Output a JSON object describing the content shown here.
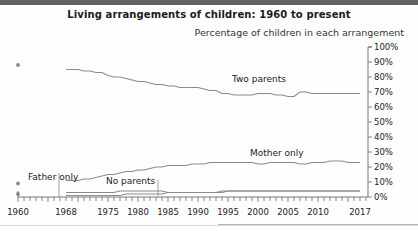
{
  "chart_data": {
    "type": "line",
    "title": "Living arrangements of children: 1960 to present",
    "subtitle": "Percentage of children in each arrangement",
    "xlabel": "",
    "ylabel": "",
    "ylim": [
      0,
      100
    ],
    "xlim": [
      1960,
      2018
    ],
    "grid": false,
    "legend_position": "inline-annotations",
    "y_ticks": [
      "0%",
      "10%",
      "20%",
      "30%",
      "40%",
      "50%",
      "60%",
      "70%",
      "80%",
      "90%",
      "100%"
    ],
    "y_tick_values": [
      0,
      10,
      20,
      30,
      40,
      50,
      60,
      70,
      80,
      90,
      100
    ],
    "x_ticks": [
      "1960",
      "1968",
      "1975",
      "1980",
      "1985",
      "1990",
      "1995",
      "2000",
      "2005",
      "2010",
      "2017"
    ],
    "x_tick_values": [
      1960,
      1968,
      1975,
      1980,
      1985,
      1990,
      1995,
      2000,
      2005,
      2010,
      2017
    ],
    "annotations": [
      {
        "text": "Two parents",
        "x": 2000,
        "y": 78
      },
      {
        "text": "Mother only",
        "x": 2003,
        "y": 29
      },
      {
        "text": "Father only",
        "x": 1966,
        "y": 13
      },
      {
        "text": "No parents",
        "x": 1979,
        "y": 10
      }
    ],
    "series": [
      {
        "name": "Two parents",
        "x": [
          1960,
          1968,
          1969,
          1970,
          1971,
          1972,
          1973,
          1974,
          1975,
          1976,
          1977,
          1978,
          1979,
          1980,
          1981,
          1982,
          1983,
          1984,
          1985,
          1986,
          1987,
          1988,
          1989,
          1990,
          1991,
          1992,
          1993,
          1994,
          1995,
          1996,
          1997,
          1998,
          1999,
          2000,
          2001,
          2002,
          2003,
          2004,
          2005,
          2006,
          2007,
          2008,
          2009,
          2010,
          2011,
          2012,
          2013,
          2014,
          2015,
          2016,
          2017
        ],
        "y": [
          88,
          85,
          85,
          85,
          84,
          84,
          83,
          83,
          81,
          80,
          80,
          79,
          78,
          77,
          77,
          76,
          75,
          75,
          74,
          74,
          73,
          73,
          73,
          73,
          72,
          71,
          71,
          69,
          69,
          68,
          68,
          68,
          68,
          69,
          69,
          69,
          68,
          68,
          67,
          67,
          70,
          70,
          69,
          69,
          69,
          69,
          69,
          69,
          69,
          69,
          69
        ]
      },
      {
        "name": "Mother only",
        "x": [
          1960,
          1968,
          1969,
          1970,
          1971,
          1972,
          1973,
          1974,
          1975,
          1976,
          1977,
          1978,
          1979,
          1980,
          1981,
          1982,
          1983,
          1984,
          1985,
          1986,
          1987,
          1988,
          1989,
          1990,
          1991,
          1992,
          1993,
          1994,
          1995,
          1996,
          1997,
          1998,
          1999,
          2000,
          2001,
          2002,
          2003,
          2004,
          2005,
          2006,
          2007,
          2008,
          2009,
          2010,
          2011,
          2012,
          2013,
          2014,
          2015,
          2016,
          2017
        ],
        "y": [
          9,
          11,
          11,
          11,
          12,
          12,
          13,
          14,
          15,
          15,
          16,
          17,
          17,
          18,
          18,
          19,
          20,
          20,
          21,
          21,
          21,
          21,
          22,
          22,
          22,
          23,
          23,
          23,
          23,
          23,
          23,
          23,
          23,
          22,
          22,
          23,
          23,
          23,
          23,
          23,
          22,
          22,
          23,
          23,
          23,
          24,
          24,
          24,
          23,
          23,
          23
        ]
      },
      {
        "name": "No parents",
        "x": [
          1960,
          1968,
          1969,
          1970,
          1971,
          1972,
          1973,
          1974,
          1975,
          1976,
          1977,
          1978,
          1979,
          1980,
          1981,
          1982,
          1983,
          1984,
          1985,
          1986,
          1987,
          1988,
          1989,
          1990,
          1991,
          1992,
          1993,
          1994,
          1995,
          1996,
          1997,
          1998,
          1999,
          2000,
          2001,
          2002,
          2003,
          2004,
          2005,
          2006,
          2007,
          2008,
          2009,
          2010,
          2011,
          2012,
          2013,
          2014,
          2015,
          2016,
          2017
        ],
        "y": [
          2,
          3,
          3,
          3,
          3,
          3,
          3,
          3,
          3,
          3,
          4,
          4,
          4,
          4,
          4,
          4,
          4,
          4,
          3,
          3,
          3,
          3,
          3,
          3,
          3,
          3,
          3,
          4,
          4,
          4,
          4,
          4,
          4,
          4,
          4,
          4,
          4,
          4,
          4,
          4,
          4,
          4,
          4,
          4,
          4,
          4,
          4,
          4,
          4,
          4,
          4
        ]
      },
      {
        "name": "Father only",
        "x": [
          1960,
          1968,
          1969,
          1970,
          1971,
          1972,
          1973,
          1974,
          1975,
          1976,
          1977,
          1978,
          1979,
          1980,
          1981,
          1982,
          1983,
          1984,
          1985,
          1986,
          1987,
          1988,
          1989,
          1990,
          1991,
          1992,
          1993,
          1994,
          1995,
          1996,
          1997,
          1998,
          1999,
          2000,
          2001,
          2002,
          2003,
          2004,
          2005,
          2006,
          2007,
          2008,
          2009,
          2010,
          2011,
          2012,
          2013,
          2014,
          2015,
          2016,
          2017
        ],
        "y": [
          1,
          1,
          1,
          1,
          1,
          1,
          1,
          1,
          1,
          1,
          1,
          2,
          2,
          2,
          2,
          2,
          2,
          2,
          3,
          3,
          3,
          3,
          3,
          3,
          3,
          3,
          3,
          3,
          4,
          4,
          4,
          4,
          4,
          4,
          4,
          4,
          4,
          4,
          4,
          4,
          4,
          4,
          4,
          4,
          4,
          4,
          4,
          4,
          4,
          4,
          4
        ]
      }
    ],
    "start_markers": [
      {
        "series": "Two parents",
        "x": 1960,
        "y": 88
      },
      {
        "series": "Mother only",
        "x": 1960,
        "y": 9
      },
      {
        "series": "No parents",
        "x": 1960,
        "y": 2
      }
    ]
  }
}
